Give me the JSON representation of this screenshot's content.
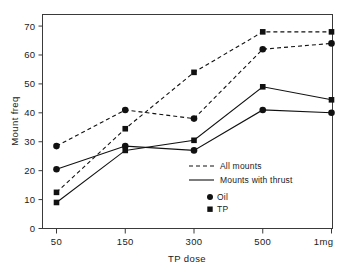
{
  "chart_data": {
    "type": "line",
    "title": "",
    "xlabel": "TP dose",
    "ylabel": "Mount freq",
    "categories": [
      "50",
      "150",
      "300",
      "500",
      "1mg"
    ],
    "ylim": [
      0,
      74
    ],
    "yticks": [
      0,
      10,
      20,
      30,
      40,
      50,
      60,
      70
    ],
    "ytick_labels": [
      "0",
      "10",
      "20",
      "30",
      "40",
      "50",
      "60",
      "70"
    ],
    "xtick_labels": [
      "50",
      "150",
      "300",
      "500",
      "1mg"
    ],
    "grid": false,
    "legend_position": "center-right-inside",
    "series": [
      {
        "name": "Oil - All mounts",
        "group": "Oil",
        "line_style": "dashed",
        "marker": "circle",
        "values": [
          28.5,
          41.0,
          38.0,
          62.0,
          64.0
        ]
      },
      {
        "name": "TP - All mounts",
        "group": "TP",
        "line_style": "dashed",
        "marker": "square",
        "values": [
          12.5,
          34.5,
          54.0,
          68.0,
          68.0
        ]
      },
      {
        "name": "Oil - Mounts with thrust",
        "group": "Oil",
        "line_style": "solid",
        "marker": "circle",
        "values": [
          20.5,
          28.5,
          27.0,
          41.0,
          40.0
        ]
      },
      {
        "name": "TP - Mounts with thrust",
        "group": "TP",
        "line_style": "solid",
        "marker": "square",
        "values": [
          9.0,
          27.0,
          30.5,
          49.0,
          44.5
        ]
      }
    ],
    "legend": {
      "style_entries": [
        {
          "label": "All mounts",
          "line_style": "dashed"
        },
        {
          "label": "Mounts with thrust",
          "line_style": "solid"
        }
      ],
      "marker_entries": [
        {
          "label": "Oil",
          "marker": "circle"
        },
        {
          "label": "TP",
          "marker": "square"
        }
      ]
    },
    "colors": {
      "ink": "#111111",
      "frame": "#3a3a3a",
      "background": "#ffffff"
    }
  }
}
